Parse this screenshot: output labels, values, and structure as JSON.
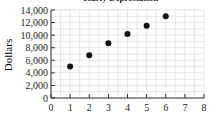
{
  "chart_data": {
    "type": "scatter",
    "title": "Yearly Depreciation",
    "xlabel": "",
    "ylabel": "Dollars",
    "x": [
      1,
      2,
      3,
      4,
      5,
      6
    ],
    "values": [
      5000,
      6800,
      8700,
      10200,
      11500,
      13000
    ],
    "xlim": [
      0,
      8
    ],
    "ylim": [
      0,
      14000
    ],
    "x_ticks": [
      "0",
      "1",
      "2",
      "3",
      "4",
      "5",
      "6",
      "7",
      "8"
    ],
    "y_ticks": [
      "0",
      "2,000",
      "4,000",
      "6,000",
      "8,000",
      "10,000",
      "12,000",
      "14,000"
    ],
    "grid": true,
    "legend": null
  },
  "colors": {
    "point": "#111111",
    "grid": "#d8d8d8",
    "axis": "#333333"
  }
}
